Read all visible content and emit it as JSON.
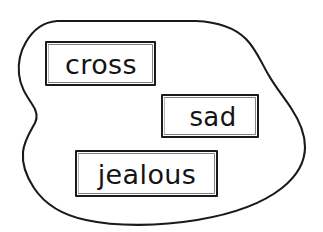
{
  "canvas": {
    "width": 323,
    "height": 232,
    "background_color": "#ffffff",
    "ink_color": "#1a1a1a"
  },
  "diagram": {
    "type": "hand-drawn set diagram",
    "region_name": "blob-region",
    "word_count": 3
  },
  "boxes": [
    {
      "id": "cross",
      "label": "cross",
      "x": 46,
      "y": 42,
      "width": 109,
      "height": 43,
      "font_size": 27,
      "text_x": 101,
      "text_baseline": 74
    },
    {
      "id": "sad",
      "label": "sad",
      "x": 162,
      "y": 95,
      "width": 96,
      "height": 42,
      "font_size": 26,
      "text_x": 213,
      "text_baseline": 126
    },
    {
      "id": "jealous",
      "label": "jealous",
      "x": 76,
      "y": 151,
      "width": 141,
      "height": 45,
      "font_size": 27,
      "text_x": 147,
      "text_baseline": 184
    }
  ]
}
